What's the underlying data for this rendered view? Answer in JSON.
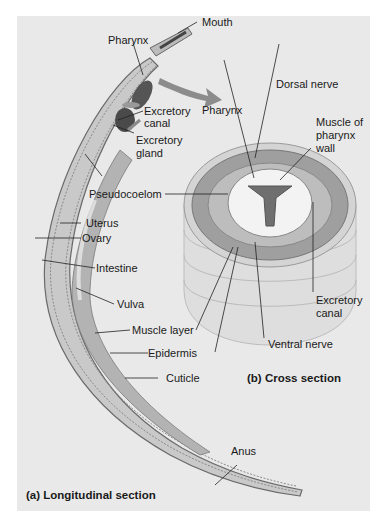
{
  "figure": {
    "background": "#e9e9e9",
    "captions": {
      "longitudinal": "(a) Longitudinal section",
      "cross": "(b) Cross section"
    },
    "labels": {
      "mouth": "Mouth",
      "pharynx_a": "Pharynx",
      "excretory_canal_a_1": "Excretory",
      "excretory_canal_a_2": "canal",
      "excretory_gland_1": "Excretory",
      "excretory_gland_2": "gland",
      "pseudocoelom": "Pseudocoelom",
      "uterus": "Uterus",
      "ovary": "Ovary",
      "intestine": "Intestine",
      "vulva": "Vulva",
      "muscle_layer": "Muscle layer",
      "epidermis": "Epidermis",
      "cuticle": "Cuticle",
      "anus": "Anus",
      "pharynx_b": "Pharynx",
      "dorsal_nerve": "Dorsal nerve",
      "muscle_pharynx_1": "Muscle of",
      "muscle_pharynx_2": "pharynx",
      "muscle_pharynx_3": "wall",
      "excretory_canal_b_1": "Excretory",
      "excretory_canal_b_2": "canal",
      "ventral_nerve": "Ventral nerve"
    }
  }
}
